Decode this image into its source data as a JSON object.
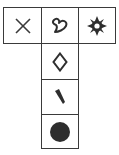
{
  "diagram": {
    "type": "cube-net",
    "stroke_color": "#3a3a3a",
    "fill_color": "#2e2e2e",
    "faces": [
      {
        "position": "top-left",
        "row": 0,
        "col": 0,
        "symbol": "x-cross-icon"
      },
      {
        "position": "top-middle",
        "row": 0,
        "col": 1,
        "symbol": "heart-outline-icon"
      },
      {
        "position": "top-right",
        "row": 0,
        "col": 2,
        "symbol": "gear-sun-icon"
      },
      {
        "position": "second-middle",
        "row": 1,
        "col": 1,
        "symbol": "diamond-outline-icon"
      },
      {
        "position": "third-middle",
        "row": 2,
        "col": 1,
        "symbol": "feather-quill-icon"
      },
      {
        "position": "bottom-middle",
        "row": 3,
        "col": 1,
        "symbol": "filled-circle-icon"
      }
    ]
  }
}
